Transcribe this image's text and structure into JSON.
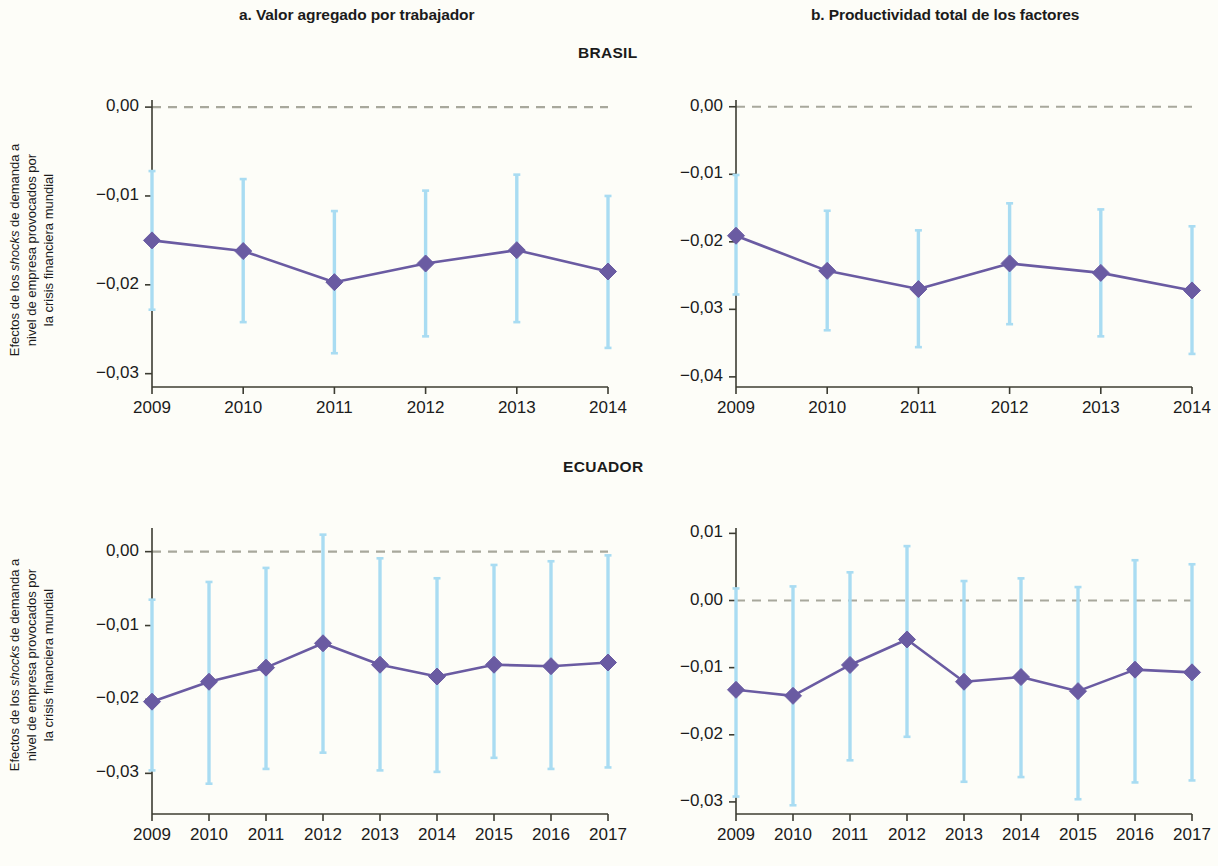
{
  "panels": {
    "a_title": "a. Valor agregado por trabajador",
    "b_title": "b. Productividad total de los factores"
  },
  "sections": {
    "brasil": "BRASIL",
    "ecuador": "ECUADOR"
  },
  "axis_label": {
    "line1": "Efectos de los ",
    "line1_em": "shocks",
    "line1b": " de demanda a",
    "line2": "nivel de empresa provocados por",
    "line3": "la crisis financiera mundial"
  },
  "colors": {
    "marker": "#6a5ba2",
    "line": "#6a5ba2",
    "error_bar": "#a9dcf2",
    "zero_line": "#a8a89c",
    "axis": "#3c3c32",
    "background": "#fdfdf8"
  },
  "chart_data": [
    {
      "id": "brasil-a",
      "type": "line",
      "title": "a. Valor agregado por trabajador",
      "section": "BRASIL",
      "xlabel": "",
      "ylabel": "Efectos de los shocks de demanda a nivel de empresa provocados por la crisis financiera mundial",
      "categories": [
        "2009",
        "2010",
        "2011",
        "2012",
        "2013",
        "2014"
      ],
      "yticks": [
        "0,00",
        "-0,01",
        "-0,02",
        "-0,03"
      ],
      "ytick_values": [
        0.0,
        -0.01,
        -0.02,
        -0.03
      ],
      "ylim": [
        -0.0315,
        0.0008
      ],
      "zero_line": 0.0,
      "grid": false,
      "legend": "none",
      "values": [
        -0.015,
        -0.0162,
        -0.0197,
        -0.0176,
        -0.0161,
        -0.0185
      ],
      "error_low": [
        -0.0228,
        -0.0242,
        -0.0277,
        -0.0258,
        -0.0242,
        -0.0271
      ],
      "error_high": [
        -0.0072,
        -0.0081,
        -0.0117,
        -0.0094,
        -0.0076,
        -0.01
      ]
    },
    {
      "id": "brasil-b",
      "type": "line",
      "title": "b. Productividad total de los factores",
      "section": "BRASIL",
      "xlabel": "",
      "ylabel": "",
      "categories": [
        "2009",
        "2010",
        "2011",
        "2012",
        "2013",
        "2014"
      ],
      "yticks": [
        "0,00",
        "-0,01",
        "-0,02",
        "-0,03",
        "-0,04"
      ],
      "ytick_values": [
        0.0,
        -0.01,
        -0.02,
        -0.03,
        -0.04
      ],
      "ylim": [
        -0.0415,
        0.001
      ],
      "zero_line": 0.0,
      "grid": false,
      "legend": "none",
      "values": [
        -0.0191,
        -0.0243,
        -0.027,
        -0.0232,
        -0.0246,
        -0.0272
      ],
      "error_low": [
        -0.0278,
        -0.0331,
        -0.0356,
        -0.0322,
        -0.034,
        -0.0366
      ],
      "error_high": [
        -0.0101,
        -0.0154,
        -0.0183,
        -0.0143,
        -0.0152,
        -0.0177
      ]
    },
    {
      "id": "ecuador-a",
      "type": "line",
      "title": "a. Valor agregado por trabajador",
      "section": "ECUADOR",
      "xlabel": "",
      "ylabel": "Efectos de los shocks de demanda a nivel de empresa provocados por la crisis financiera mundial",
      "categories": [
        "2009",
        "2010",
        "2011",
        "2012",
        "2013",
        "2014",
        "2015",
        "2016",
        "2017"
      ],
      "yticks": [
        "0,00",
        "-0,01",
        "-0,02",
        "-0,03"
      ],
      "ytick_values": [
        0.0,
        -0.01,
        -0.02,
        -0.03
      ],
      "ylim": [
        -0.0355,
        0.0032
      ],
      "zero_line": 0.0,
      "grid": false,
      "legend": "none",
      "values": [
        -0.0203,
        -0.0176,
        -0.0157,
        -0.0124,
        -0.0153,
        -0.0169,
        -0.0153,
        -0.0155,
        -0.015
      ],
      "error_low": [
        -0.0296,
        -0.0314,
        -0.0294,
        -0.0272,
        -0.0296,
        -0.0298,
        -0.0279,
        -0.0294,
        -0.0292
      ],
      "error_high": [
        -0.0065,
        -0.0041,
        -0.0022,
        0.0023,
        -0.0009,
        -0.0036,
        -0.0018,
        -0.0013,
        -0.0005
      ]
    },
    {
      "id": "ecuador-b",
      "type": "line",
      "title": "b. Productividad total de los factores",
      "section": "ECUADOR",
      "xlabel": "",
      "ylabel": "",
      "categories": [
        "2009",
        "2010",
        "2011",
        "2012",
        "2013",
        "2014",
        "2015",
        "2016",
        "2017"
      ],
      "yticks": [
        "0,01",
        "0,00",
        "-0,01",
        "-0,02",
        "-0,03"
      ],
      "ytick_values": [
        0.01,
        0.0,
        -0.01,
        -0.02,
        -0.03
      ],
      "ylim": [
        -0.0318,
        0.0108
      ],
      "zero_line": 0.0,
      "grid": false,
      "legend": "none",
      "values": [
        -0.0133,
        -0.0142,
        -0.0096,
        -0.0058,
        -0.0121,
        -0.0114,
        -0.0135,
        -0.0103,
        -0.0107
      ],
      "error_low": [
        -0.0292,
        -0.0305,
        -0.0238,
        -0.0203,
        -0.027,
        -0.0263,
        -0.0296,
        -0.0271,
        -0.0268
      ],
      "error_high": [
        0.0018,
        0.0021,
        0.0042,
        0.0081,
        0.0029,
        0.0033,
        0.002,
        0.006,
        0.0054
      ]
    }
  ]
}
